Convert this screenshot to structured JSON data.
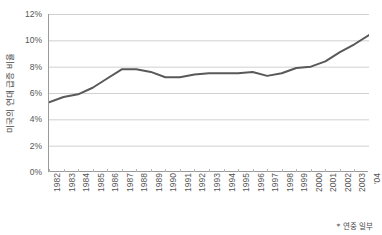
{
  "chart_data": {
    "type": "line",
    "title": "",
    "xlabel": "",
    "ylabel": "미국의 연대 급증 비율",
    "footnote": "* 연중 일부",
    "grid": true,
    "legend": "none",
    "line_color": "#595959",
    "grid_color": "#d0d0d0",
    "axis_color": "#9a9a9a",
    "ylim": [
      0,
      12
    ],
    "ytick_labels": [
      "12%",
      "10%",
      "8%",
      "6%",
      "4%",
      "2%",
      "0%"
    ],
    "ytick_values": [
      12,
      10,
      8,
      6,
      4,
      2,
      0
    ],
    "categories": [
      "1982",
      "1983",
      "1984",
      "1985",
      "1986",
      "1987",
      "1988",
      "1989",
      "1990",
      "1991",
      "1992",
      "1993",
      "1994",
      "1995",
      "1996",
      "1997",
      "1998",
      "1999",
      "2000",
      "2001",
      "2002",
      "2003",
      "'04"
    ],
    "values": [
      5.3,
      5.7,
      5.9,
      6.4,
      7.1,
      7.8,
      7.8,
      7.6,
      7.2,
      7.2,
      7.4,
      7.5,
      7.5,
      7.5,
      7.6,
      7.3,
      7.5,
      7.9,
      8.0,
      8.4,
      9.1,
      9.7,
      10.4
    ]
  }
}
